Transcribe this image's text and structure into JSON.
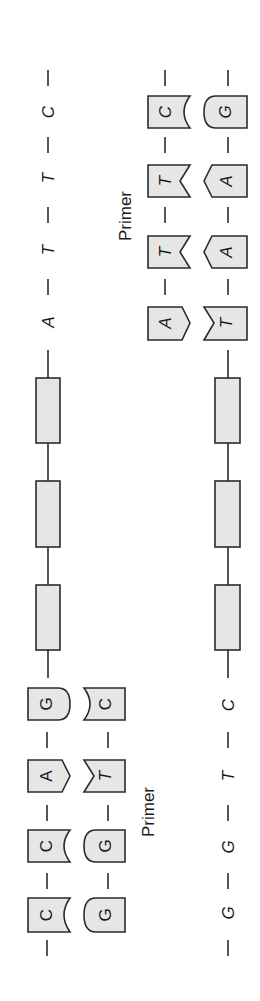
{
  "diagram": {
    "orientation": "rotated-90-ccw",
    "colors": {
      "background": "#ffffff",
      "box_fill": "#e6e6e6",
      "stroke": "#2b2b2b",
      "text": "#1a1a1a"
    },
    "labels": {
      "primer_top": "Primer",
      "primer_bottom": "Primer"
    },
    "top_section": {
      "template_strand": [
        "C",
        "T",
        "T",
        "A"
      ],
      "primer_strand": [
        "C",
        "T",
        "T",
        "A"
      ],
      "complement_strand": [
        "G",
        "A",
        "A",
        "T"
      ]
    },
    "bottom_section": {
      "primer_strand": [
        "G",
        "A",
        "C",
        "C"
      ],
      "complement_strand": [
        "C",
        "T",
        "G",
        "G"
      ],
      "template_strand": [
        "C",
        "T",
        "G",
        "G"
      ]
    },
    "exons": {
      "count_per_strand": 3
    }
  }
}
